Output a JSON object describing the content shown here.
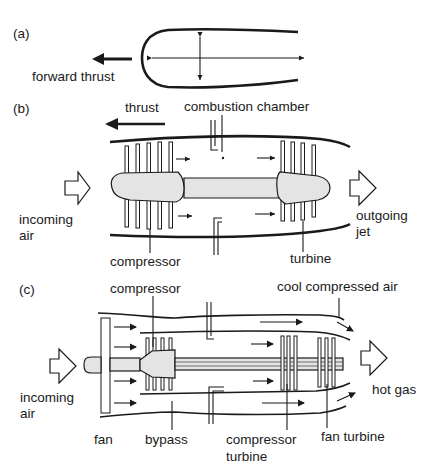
{
  "figure": {
    "panels": [
      {
        "id": "a",
        "label": "(a)",
        "annotations": [
          "forward thrust"
        ]
      },
      {
        "id": "b",
        "label": "(b)",
        "annotations": [
          "thrust",
          "combustion chamber",
          "incoming",
          "air",
          "compressor",
          "turbine",
          "outgoing",
          "jet"
        ]
      },
      {
        "id": "c",
        "label": "(c)",
        "annotations": [
          "compressor",
          "cool compressed air",
          "incoming",
          "air",
          "hot gas",
          "fan",
          "bypass",
          "compressor",
          "turbine",
          "fan turbine"
        ]
      }
    ]
  },
  "panel_a": {
    "label": "(a)",
    "forward_thrust": "forward thrust"
  },
  "panel_b": {
    "label": "(b)",
    "thrust": "thrust",
    "combustion_chamber": "combustion chamber",
    "incoming_line1": "incoming",
    "incoming_line2": "air",
    "compressor": "compressor",
    "turbine": "turbine",
    "outgoing_line1": "outgoing",
    "outgoing_line2": "jet"
  },
  "panel_c": {
    "label": "(c)",
    "compressor": "compressor",
    "cool_compressed_air": "cool compressed air",
    "incoming_line1": "incoming",
    "incoming_line2": "air",
    "hot_gas": "hot gas",
    "fan": "fan",
    "bypass": "bypass",
    "compressor_turbine_line1": "compressor",
    "compressor_turbine_line2": "turbine",
    "fan_turbine": "fan turbine"
  },
  "colors": {
    "ink": "#1a1a1a",
    "spool_fill": "#e4e4e4",
    "background": "#ffffff"
  }
}
